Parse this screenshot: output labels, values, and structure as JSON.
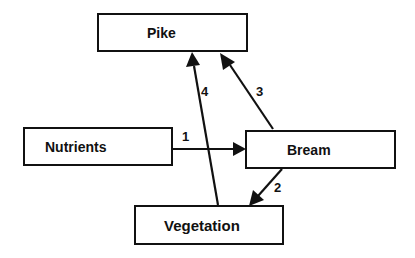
{
  "nodes": {
    "pike": {
      "label": "Pike"
    },
    "nutrients": {
      "label": "Nutrients"
    },
    "bream": {
      "label": "Bream"
    },
    "vegetation": {
      "label": "Vegetation"
    }
  },
  "edges": [
    {
      "id": "1",
      "label": "1",
      "from": "Nutrients",
      "to": "Bream"
    },
    {
      "id": "2",
      "label": "2",
      "from": "Bream",
      "to": "Vegetation"
    },
    {
      "id": "3",
      "label": "3",
      "from": "Bream",
      "to": "Pike"
    },
    {
      "id": "4",
      "label": "4",
      "from": "Vegetation",
      "to": "Pike"
    }
  ],
  "colors": {
    "stroke": "#111111",
    "background": "#ffffff"
  }
}
